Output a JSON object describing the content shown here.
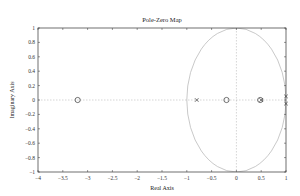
{
  "chart_data": {
    "type": "scatter",
    "title": "Pole-Zero Map",
    "xlabel": "Real Axis",
    "ylabel": "Imaginary Axis",
    "xlim": [
      -4,
      1
    ],
    "ylim": [
      -1,
      1
    ],
    "xticks": [
      "-4",
      "-3.5",
      "-3",
      "-2.5",
      "-2",
      "-1.5",
      "-1",
      "-0.5",
      "0",
      "0.5",
      "1"
    ],
    "yticks": [
      "-1",
      "-0.8",
      "-0.6",
      "-0.4",
      "-0.2",
      "0",
      "0.2",
      "0.4",
      "0.6",
      "0.8",
      "1"
    ],
    "grid": false,
    "unit_circle": true,
    "series": [
      {
        "name": "Zeros",
        "marker": "o",
        "points": [
          [
            -3.2,
            0
          ],
          [
            -0.2,
            0
          ],
          [
            0.48,
            0
          ]
        ]
      },
      {
        "name": "Poles",
        "marker": "x",
        "points": [
          [
            -0.8,
            0
          ],
          [
            0.5,
            0
          ],
          [
            1.0,
            0.05
          ],
          [
            1.0,
            -0.05
          ]
        ]
      }
    ]
  },
  "colors": {
    "axis": "#333333",
    "circle": "#bbbbbb",
    "dashed": "#aaaaaa",
    "marker": "#333333"
  }
}
